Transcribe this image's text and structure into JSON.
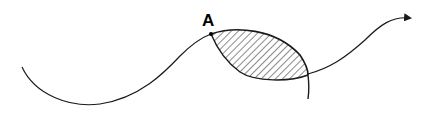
{
  "diagram": {
    "point_label": "A",
    "colors": {
      "stroke": "#1a1a1a",
      "background": "#ffffff",
      "hatch": "#2a2a2a"
    },
    "elements": [
      {
        "type": "curve",
        "description": "wavy directed curve ending in arrowhead at right"
      },
      {
        "type": "region",
        "description": "hatched lens-shaped region starting at point A"
      },
      {
        "type": "curve",
        "description": "second curve bounding lens from below, exiting downward"
      },
      {
        "type": "point",
        "label": "A"
      }
    ]
  }
}
